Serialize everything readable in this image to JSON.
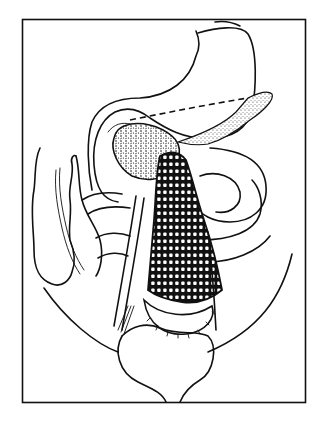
{
  "figure": {
    "type": "anatomical-line-illustration",
    "frame": {
      "x": 22,
      "y": 19,
      "width": 283,
      "height": 383,
      "stroke": "#111111"
    },
    "colors": {
      "background": "#ffffff",
      "ink": "#111111"
    },
    "elements": [
      {
        "name": "stomach"
      },
      {
        "name": "pancreas"
      },
      {
        "name": "resection-line",
        "style": "dashed"
      },
      {
        "name": "gallbladder-mass",
        "style": "stippled"
      },
      {
        "name": "mesh-covered-segment",
        "style": "crosshatched"
      },
      {
        "name": "ascending-colon"
      },
      {
        "name": "small-intestine-loops"
      },
      {
        "name": "pelvic-outline"
      },
      {
        "name": "bladder"
      }
    ]
  }
}
